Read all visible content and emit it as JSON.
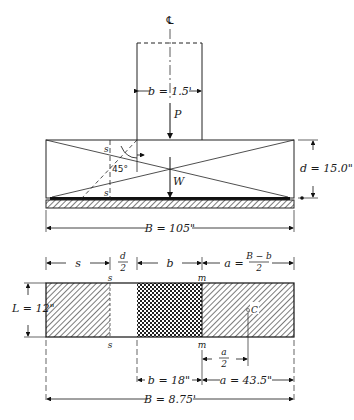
{
  "figure": {
    "type": "footing-design-diagram",
    "elevation_view": {
      "centerline_symbol": "℄",
      "column_width_label": "b = 1.5'",
      "load_label": "P",
      "weight_label": "W",
      "section_label_top": "s",
      "section_label_bottom": "s",
      "angle_label": "45°",
      "depth_label": "d = 15.0\"",
      "width_label": "B = 105\""
    },
    "plan_view": {
      "top_dims": {
        "s": "s",
        "d_over_2_num": "d",
        "d_over_2_den": "2",
        "b": "b",
        "a_prefix": "a =",
        "a_num": "B − b",
        "a_den": "2"
      },
      "section_s_top": "s",
      "section_s_bottom": "s",
      "section_m_top": "m",
      "section_m_bottom": "m",
      "length_label": "L = 12\"",
      "centroid_label": "C",
      "a_half_num": "a",
      "a_half_den": "2",
      "b_value_label": "b = 18\"",
      "a_value_label": "a = 43.5\"",
      "total_width_label": "B = 8.75'"
    }
  }
}
